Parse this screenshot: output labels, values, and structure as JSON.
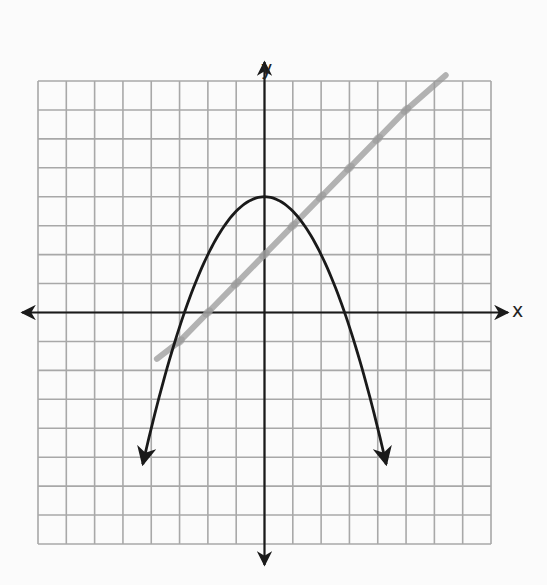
{
  "chart_data": {
    "type": "line",
    "title": "",
    "xlabel": "x",
    "ylabel": "y",
    "xlim": [
      -8,
      8
    ],
    "ylim": [
      -8,
      8
    ],
    "grid": true,
    "grid_step": 1,
    "axes": {
      "x_arrows": true,
      "y_arrows": true,
      "tick_labels": false
    },
    "series": [
      {
        "name": "parabola",
        "equation": "y = 4 - 0.5x^2",
        "style": "solid black, arrows at both ends",
        "color": "#1a1a1a",
        "vertex": [
          0,
          4
        ],
        "x_intercepts": [
          -2.9,
          2.9
        ],
        "x_range": [
          -4.3,
          4.3
        ],
        "points": [
          [
            -4.3,
            -5.2
          ],
          [
            -4,
            -4
          ],
          [
            -3,
            -0.5
          ],
          [
            -2,
            2
          ],
          [
            -1,
            3.5
          ],
          [
            0,
            4
          ],
          [
            1,
            3.5
          ],
          [
            2,
            2
          ],
          [
            3,
            -0.5
          ],
          [
            4,
            -4
          ],
          [
            4.3,
            -5.2
          ]
        ]
      },
      {
        "name": "hand-drawn line",
        "equation": "y = x + 2",
        "style": "gray pencil stroke with small tick marks",
        "color": "#9a9a9a",
        "x_range": [
          -3.8,
          6.4
        ],
        "points": [
          [
            -3.8,
            -1.6
          ],
          [
            -3,
            -1
          ],
          [
            -2,
            0
          ],
          [
            -1,
            1
          ],
          [
            0,
            2
          ],
          [
            1,
            3
          ],
          [
            2,
            4
          ],
          [
            3,
            5
          ],
          [
            4,
            6
          ],
          [
            5,
            7
          ],
          [
            6.4,
            8.2
          ]
        ]
      }
    ]
  },
  "labels": {
    "x_axis": "x",
    "y_axis": "y"
  },
  "colors": {
    "grid": "#a8a8a8",
    "axis": "#1a1a1a",
    "curve": "#1a1a1a",
    "pencil": "#9a9a9a",
    "background": "#fbfbfb"
  }
}
